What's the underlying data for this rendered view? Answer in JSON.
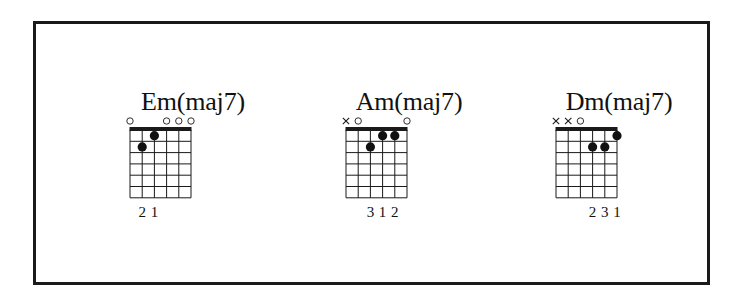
{
  "diagram": {
    "type": "guitar-chord-chart",
    "strings": 6,
    "frets_shown": 6,
    "colors": {
      "line": "#1a1a1a",
      "dot": "#111111",
      "background": "#ffffff"
    },
    "chords": [
      {
        "name": "Em(maj7)",
        "string_markers": [
          "open",
          "",
          "",
          "open",
          "open",
          "open"
        ],
        "dots": [
          {
            "string": 2,
            "fret": 2,
            "finger": "2"
          },
          {
            "string": 3,
            "fret": 1,
            "finger": "1"
          }
        ],
        "finger_labels": [
          "",
          "2",
          "1",
          "",
          "",
          ""
        ]
      },
      {
        "name": "Am(maj7)",
        "string_markers": [
          "mute",
          "open",
          "",
          "",
          "",
          "open"
        ],
        "dots": [
          {
            "string": 3,
            "fret": 2,
            "finger": "3"
          },
          {
            "string": 4,
            "fret": 1,
            "finger": "1"
          },
          {
            "string": 5,
            "fret": 1,
            "finger": "2"
          }
        ],
        "finger_labels": [
          "",
          "",
          "3",
          "1",
          "2",
          ""
        ]
      },
      {
        "name": "Dm(maj7)",
        "string_markers": [
          "mute",
          "mute",
          "open",
          "",
          "",
          ""
        ],
        "dots": [
          {
            "string": 4,
            "fret": 2,
            "finger": "2"
          },
          {
            "string": 5,
            "fret": 2,
            "finger": "3"
          },
          {
            "string": 6,
            "fret": 1,
            "finger": "1"
          }
        ],
        "finger_labels": [
          "",
          "",
          "",
          "2",
          "3",
          "1"
        ]
      }
    ]
  }
}
